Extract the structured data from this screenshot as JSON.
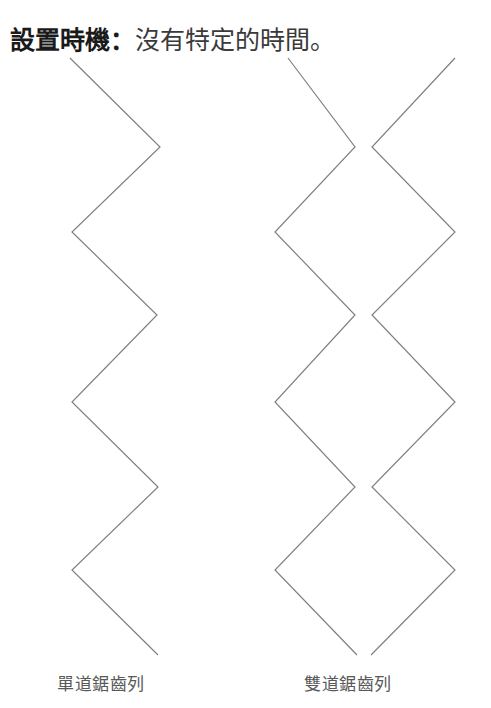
{
  "page": {
    "width": 491,
    "height": 708,
    "background_color": "#ffffff"
  },
  "title": {
    "bold_part": "設置時機：",
    "normal_part": "沒有特定的時間。",
    "full_text": "設置時機：沒有特定的時間。"
  },
  "figure": {
    "stroke_color": "#808080",
    "stroke_width": 1.2,
    "single_row": {
      "name": "single-sawtooth-row",
      "points": "70,58 160,147 72,232 157,315 72,402 158,487 72,570 158,655"
    },
    "double_row": {
      "name": "double-sawtooth-row",
      "left_polyline_points": "288,58 355,147 275,232 355,315 275,402 355,487 275,570 357,655",
      "right_polyline_points": "455,58 372,147 455,232 372,315 455,402 372,487 455,570 371,655"
    }
  },
  "captions": {
    "single": "單道鋸齒列",
    "double": "雙道鋸齒列"
  }
}
